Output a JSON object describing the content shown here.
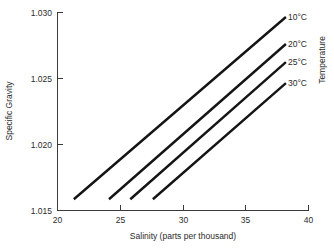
{
  "chart_data": {
    "type": "line",
    "title": "",
    "xlabel": "Salinity (parts per thousand)",
    "ylabel": "Specific Gravity",
    "legend_title": "Temperature",
    "legend_position": "right-inline",
    "grid": false,
    "xlim": [
      20,
      40
    ],
    "ylim": [
      1.015,
      1.03
    ],
    "xticks": [
      20,
      25,
      30,
      35,
      40
    ],
    "yticks": [
      1.015,
      1.02,
      1.025,
      1.03
    ],
    "xtick_labels": [
      "20",
      "25",
      "30",
      "35",
      "40"
    ],
    "ytick_labels": [
      "1.015",
      "1.020",
      "1.025",
      "1.030"
    ],
    "series": [
      {
        "name": "10°C",
        "x": [
          21.3,
          38.2
        ],
        "y": [
          1.01585,
          1.02962
        ]
      },
      {
        "name": "20°C",
        "x": [
          24.1,
          38.2
        ],
        "y": [
          1.01585,
          1.02758
        ]
      },
      {
        "name": "25°C",
        "x": [
          25.8,
          38.2
        ],
        "y": [
          1.01585,
          1.02621
        ]
      },
      {
        "name": "30°C",
        "x": [
          27.6,
          38.2
        ],
        "y": [
          1.01585,
          1.02462
        ]
      }
    ],
    "line_color": "#141414",
    "axis_color": "#3a3a3a",
    "background_color": "#ffffff"
  },
  "labels": {
    "y_axis_title": "Specific Gravity",
    "x_axis_title": "Salinity (parts per thousand)",
    "legend_axis_title": "Temperature",
    "ytick_0": "1.015",
    "ytick_1": "1.020",
    "ytick_2": "1.025",
    "ytick_3": "1.030",
    "xtick_0": "20",
    "xtick_1": "25",
    "xtick_2": "30",
    "xtick_3": "35",
    "xtick_4": "40",
    "series_0": "10°C",
    "series_1": "20°C",
    "series_2": "25°C",
    "series_3": "30°C"
  }
}
